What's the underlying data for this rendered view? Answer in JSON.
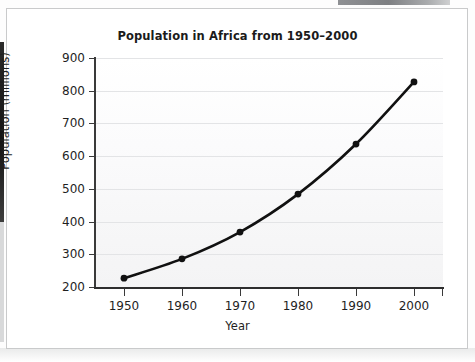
{
  "chart_data": {
    "type": "line",
    "title": "Population in Africa from 1950–2000",
    "xlabel": "Year",
    "ylabel": "Population (millions)",
    "x": [
      1950,
      1960,
      1970,
      1980,
      1990,
      2000
    ],
    "categories": [
      "1950",
      "1960",
      "1970",
      "1980",
      "1990",
      "2000"
    ],
    "values": [
      227,
      286,
      368,
      484,
      637,
      827
    ],
    "series": [
      {
        "name": "Population in Africa",
        "values": [
          227,
          286,
          368,
          484,
          637,
          827
        ]
      }
    ],
    "xlim": [
      1945,
      2005
    ],
    "ylim": [
      200,
      900
    ],
    "ytick_labels": [
      "900",
      "800",
      "700",
      "600",
      "500",
      "400",
      "300",
      "200"
    ],
    "yticks": [
      900,
      800,
      700,
      600,
      500,
      400,
      300,
      200
    ],
    "xtick_labels": [
      "1950",
      "1960",
      "1970",
      "1980",
      "1990",
      "2000"
    ],
    "grid": "horizontal",
    "legend": "none",
    "marker": "filled-circle",
    "line_color": "#111111",
    "marker_color": "#111111",
    "plot_background": "#f7f7f8",
    "gridline_color": "#e3e4e6"
  },
  "figure": {
    "card_background": "#ffffff",
    "card_border_color": "#c9cacb"
  }
}
